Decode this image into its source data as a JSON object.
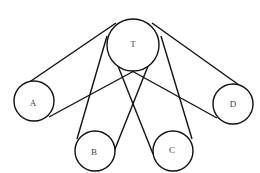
{
  "diagram": {
    "pulleys": [
      {
        "id": "T",
        "label": "T",
        "role": "driver"
      },
      {
        "id": "A",
        "label": "A"
      },
      {
        "id": "B",
        "label": "B"
      },
      {
        "id": "C",
        "label": "C"
      },
      {
        "id": "D",
        "label": "D"
      }
    ],
    "belts": [
      {
        "from": "T",
        "to": "A",
        "type": "crossed"
      },
      {
        "from": "T",
        "to": "B",
        "type": "crossed"
      },
      {
        "from": "T",
        "to": "C",
        "type": "crossed"
      },
      {
        "from": "T",
        "to": "D",
        "type": "crossed"
      }
    ]
  }
}
